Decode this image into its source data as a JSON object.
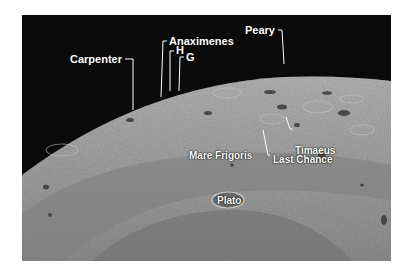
{
  "image": {
    "subject": "Lunar north polar region oblique view",
    "background_color": "#ffffff",
    "sky_color": "#0a0a0a",
    "surface_color": "#9a9a9a"
  },
  "labels": [
    {
      "id": "carpenter",
      "text": "Carpenter"
    },
    {
      "id": "anaximenes",
      "text": "Anaximenes"
    },
    {
      "id": "h",
      "text": "H"
    },
    {
      "id": "g",
      "text": "G"
    },
    {
      "id": "peary",
      "text": "Peary"
    },
    {
      "id": "timaeus",
      "text": "Timaeus"
    },
    {
      "id": "last-chance",
      "text": "Last Chance"
    },
    {
      "id": "mare-frigoris",
      "text": "Mare Frigoris"
    },
    {
      "id": "plato",
      "text": "Plato"
    }
  ]
}
